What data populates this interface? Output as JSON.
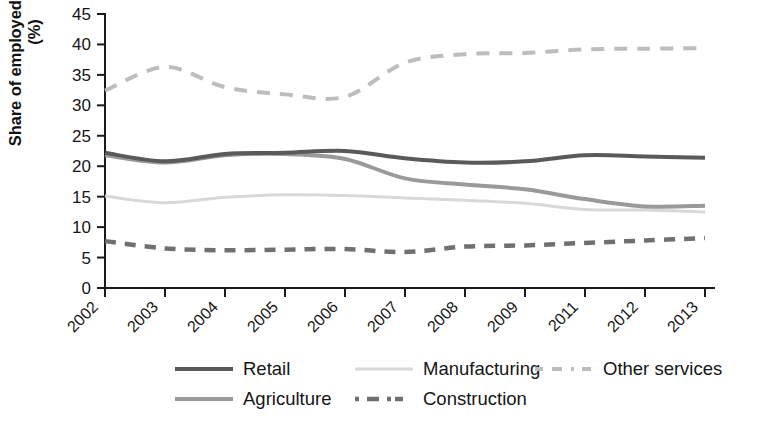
{
  "chart_data": {
    "type": "line",
    "title": "",
    "xlabel": "",
    "ylabel": "Share of employed workforce\n(%)",
    "ylabel_line1": "Share of employed workforce",
    "ylabel_line2": "(%)",
    "categories": [
      "2002",
      "2003",
      "2004",
      "2005",
      "2006",
      "2007",
      "2008",
      "2009",
      "2011",
      "2012",
      "2013"
    ],
    "ylim": [
      0,
      45
    ],
    "ytick_labels": [
      "0",
      "5",
      "10",
      "15",
      "20",
      "25",
      "30",
      "35",
      "40",
      "45"
    ],
    "yticks": [
      0,
      5,
      10,
      15,
      20,
      25,
      30,
      35,
      40,
      45
    ],
    "grid": false,
    "legend_position": "bottom",
    "series": [
      {
        "name": "Retail",
        "color": "#5a5a5a",
        "style": "solid",
        "width": 4,
        "values": [
          22.2,
          20.8,
          22.0,
          22.2,
          22.5,
          21.3,
          20.6,
          20.8,
          21.8,
          21.6,
          21.4
        ]
      },
      {
        "name": "Agriculture",
        "color": "#9a9a9a",
        "style": "solid",
        "width": 4,
        "values": [
          21.8,
          20.6,
          21.8,
          22.0,
          21.2,
          18.0,
          17.0,
          16.2,
          14.6,
          13.4,
          13.5
        ]
      },
      {
        "name": "Manufacturing",
        "color": "#d8d8d8",
        "style": "solid",
        "width": 3,
        "values": [
          15.1,
          14.0,
          14.9,
          15.3,
          15.2,
          14.8,
          14.4,
          13.9,
          12.9,
          12.8,
          12.5
        ]
      },
      {
        "name": "Other services",
        "color": "#bdbdbd",
        "style": "dashed",
        "width": 4,
        "values": [
          32.4,
          36.3,
          33.0,
          31.8,
          31.4,
          37.0,
          38.4,
          38.6,
          39.2,
          39.3,
          39.4
        ]
      },
      {
        "name": "Construction",
        "color": "#707070",
        "style": "dashed",
        "width": 4.5,
        "values": [
          7.7,
          6.5,
          6.2,
          6.3,
          6.4,
          5.9,
          6.8,
          7.0,
          7.4,
          7.8,
          8.2
        ]
      }
    ]
  },
  "legend": {
    "items": [
      {
        "label": "Retail",
        "series": "Retail"
      },
      {
        "label": "Manufacturing",
        "series": "Manufacturing"
      },
      {
        "label": "Other services",
        "series": "Other services"
      },
      {
        "label": "Agriculture",
        "series": "Agriculture"
      },
      {
        "label": "Construction",
        "series": "Construction"
      }
    ]
  }
}
